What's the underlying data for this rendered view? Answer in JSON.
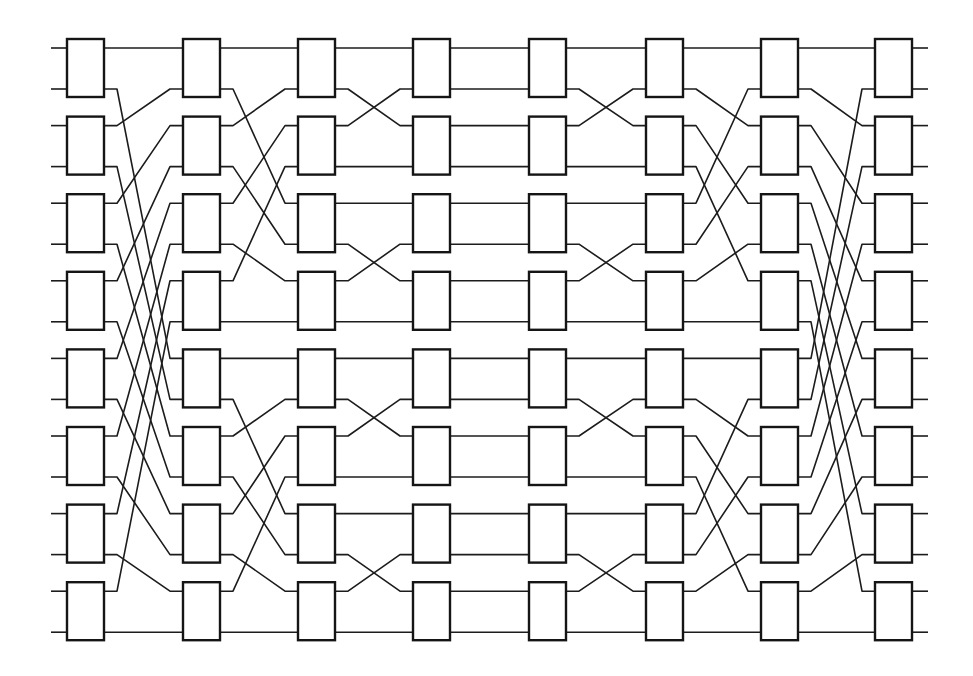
{
  "diagram": {
    "type": "switching-network",
    "num_lines": 16,
    "switches_per_column": 8,
    "num_columns": 8,
    "colors": {
      "stroke": "#1c1c1c",
      "box_fill": "#ffffff",
      "background": "#ffffff"
    },
    "geometry": {
      "column_left_x": [
        67,
        183,
        298,
        413,
        529,
        646,
        761,
        875
      ],
      "box_width": 37,
      "box_height": 58,
      "first_box_top": 39,
      "box_pitch": 77.6,
      "port_offsets": [
        9,
        50
      ],
      "input_stub_x": 51,
      "output_stub_x": 928,
      "bend_stub": 13
    },
    "stages": [
      {
        "from_column": 1,
        "to_column": 2,
        "pattern": "unshuffle-16",
        "map": [
          0,
          8,
          1,
          9,
          2,
          10,
          3,
          11,
          4,
          12,
          5,
          13,
          6,
          14,
          7,
          15
        ]
      },
      {
        "from_column": 2,
        "to_column": 3,
        "pattern": "unshuffle-8",
        "map": [
          0,
          4,
          1,
          5,
          2,
          6,
          3,
          7,
          8,
          12,
          9,
          13,
          10,
          14,
          11,
          15
        ]
      },
      {
        "from_column": 3,
        "to_column": 4,
        "pattern": "adjacent-swap",
        "map": [
          0,
          2,
          1,
          3,
          4,
          6,
          5,
          7,
          8,
          10,
          9,
          11,
          12,
          14,
          13,
          15
        ]
      },
      {
        "from_column": 4,
        "to_column": 5,
        "pattern": "straight",
        "map": [
          0,
          1,
          2,
          3,
          4,
          5,
          6,
          7,
          8,
          9,
          10,
          11,
          12,
          13,
          14,
          15
        ]
      },
      {
        "from_column": 5,
        "to_column": 6,
        "pattern": "adjacent-swap",
        "map": [
          0,
          2,
          1,
          3,
          4,
          6,
          5,
          7,
          8,
          10,
          9,
          11,
          12,
          14,
          13,
          15
        ]
      },
      {
        "from_column": 6,
        "to_column": 7,
        "pattern": "shuffle-8",
        "map": [
          0,
          2,
          4,
          6,
          1,
          3,
          5,
          7,
          8,
          10,
          12,
          14,
          9,
          11,
          13,
          15
        ]
      },
      {
        "from_column": 7,
        "to_column": 8,
        "pattern": "shuffle-16",
        "map": [
          0,
          2,
          4,
          6,
          8,
          10,
          12,
          14,
          1,
          3,
          5,
          7,
          9,
          11,
          13,
          15
        ]
      }
    ]
  }
}
